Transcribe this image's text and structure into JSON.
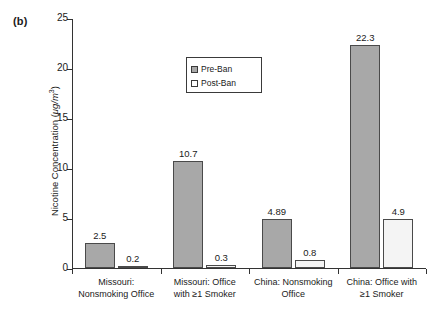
{
  "panel": {
    "label": "(b)"
  },
  "legend": {
    "position": "inside-top-left",
    "entries": [
      {
        "label": "Pre-Ban",
        "swatch": "pre",
        "color": "#a8a8a8"
      },
      {
        "label": "Post-Ban",
        "swatch": "post",
        "color": "#ffffff"
      }
    ]
  },
  "axes": {
    "y_title_main": "Nicotine Concentration (",
    "y_title_unit": "μg/m",
    "y_title_exp": "3",
    "y_title_close": ")",
    "y_title_full": "Nicotine Concentration (μg/m³)",
    "y_ticks": [
      "0",
      "5",
      "10",
      "15",
      "20",
      "25"
    ]
  },
  "chart_data": {
    "type": "bar",
    "title": "",
    "xlabel": "",
    "ylabel": "Nicotine Concentration (μg/m³)",
    "ylim": [
      0,
      25
    ],
    "yticks": [
      0,
      5,
      10,
      15,
      20,
      25
    ],
    "grid": false,
    "legend_position": "upper left inside",
    "categories": [
      "Missouri: Nonsmoking Office",
      "Missouri: Office with ≥1 Smoker",
      "China: Nonsmoking Office",
      "China: Office with ≥1 Smoker"
    ],
    "category_lines": [
      [
        "Missouri:",
        "Nonsmoking Office"
      ],
      [
        "Missouri: Office",
        "with ≥1 Smoker"
      ],
      [
        "China: Nonsmoking",
        "Office"
      ],
      [
        "China: Office with",
        "≥1 Smoker"
      ]
    ],
    "series": [
      {
        "name": "Pre-Ban",
        "color": "#a8a8a8",
        "values": [
          2.5,
          10.7,
          4.89,
          22.3
        ],
        "labels": [
          "2.5",
          "10.7",
          "4.89",
          "22.3"
        ]
      },
      {
        "name": "Post-Ban",
        "color": "#f4f4f4",
        "values": [
          0.2,
          0.3,
          0.8,
          4.9
        ],
        "labels": [
          "0.2",
          "0.3",
          "0.8",
          "4.9"
        ]
      }
    ]
  }
}
